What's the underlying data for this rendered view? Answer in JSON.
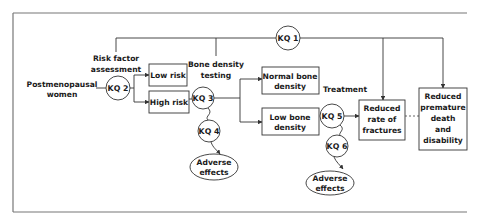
{
  "diagram": {
    "labels": {
      "population": [
        "Postmenopausal",
        "women"
      ],
      "risk_assessment": [
        "Risk factor",
        "assessment"
      ],
      "bone_density_testing": [
        "Bone density",
        "testing"
      ],
      "treatment": "Treatment"
    },
    "boxes": {
      "low_risk": [
        "Low risk"
      ],
      "high_risk": [
        "High risk"
      ],
      "normal_bone": [
        "Normal bone",
        "density"
      ],
      "low_bone": [
        "Low bone",
        "density"
      ],
      "fractures": [
        "Reduced",
        "rate of",
        "fractures"
      ],
      "premature_death": [
        "Reduced",
        "premature",
        "death",
        "and",
        "disability"
      ]
    },
    "ellipses": {
      "adverse_1": [
        "Adverse",
        "effects"
      ],
      "adverse_2": [
        "Adverse",
        "effects"
      ]
    },
    "key_questions": {
      "kq1": "KQ 1",
      "kq2": "KQ 2",
      "kq3": "KQ 3",
      "kq4": "KQ 4",
      "kq5": "KQ 5",
      "kq6": "KQ 6"
    },
    "colors": {
      "line": "#333333",
      "frame": "#777777",
      "text": "#1a1a1a",
      "background": "#ffffff"
    }
  }
}
